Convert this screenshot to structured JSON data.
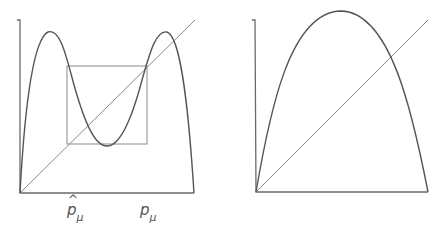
{
  "figure": {
    "panels": [
      {
        "id": "left",
        "description": "Second iterate f^2 of logistic map with two humps, diagonal, and square box marking fixed points",
        "labels": [
          {
            "base": "p",
            "hat": "^",
            "sub": "μ",
            "name": "p-hat-mu"
          },
          {
            "base": "p",
            "sub": "μ",
            "name": "p-mu"
          }
        ]
      },
      {
        "id": "right",
        "description": "Logistic map single hump with diagonal line",
        "labels": []
      }
    ],
    "colors": {
      "axis": "#6a6a6a",
      "curve": "#555555",
      "diagonal": "#8a8a8a",
      "background": "#ffffff"
    }
  }
}
